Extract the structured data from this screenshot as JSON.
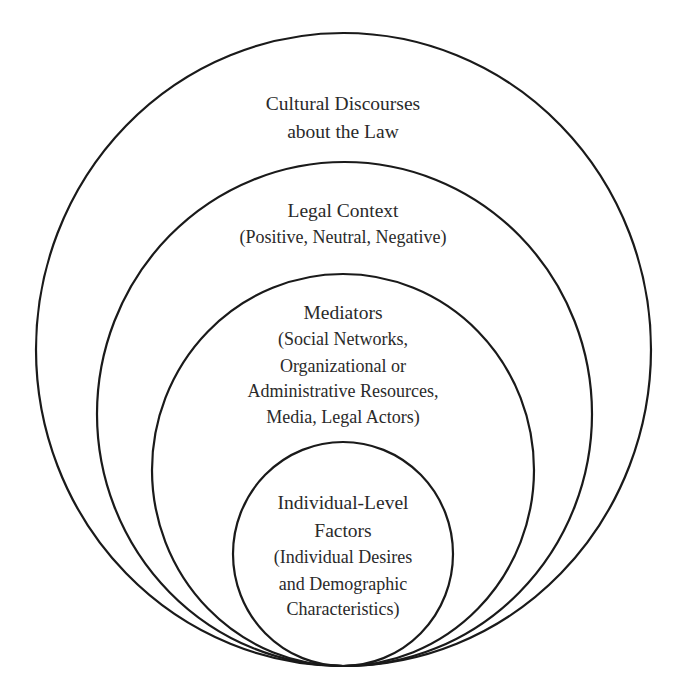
{
  "diagram": {
    "type": "nested-circles",
    "stroke_color": "#1a1a1a",
    "text_color": "#2a2a2a",
    "levels": [
      {
        "id": "cultural-discourses",
        "title_lines": [
          "Cultural Discourses",
          "about the Law"
        ],
        "sub_lines": []
      },
      {
        "id": "legal-context",
        "title_lines": [
          "Legal Context"
        ],
        "sub_lines": [
          "(Positive, Neutral, Negative)"
        ]
      },
      {
        "id": "mediators",
        "title_lines": [
          "Mediators"
        ],
        "sub_lines": [
          "(Social Networks,",
          "Organizational or",
          "Administrative Resources,",
          "Media, Legal Actors)"
        ]
      },
      {
        "id": "individual-level-factors",
        "title_lines": [
          "Individual-Level",
          "Factors"
        ],
        "sub_lines": [
          "(Individual Desires",
          "and Demographic",
          "Characteristics)"
        ]
      }
    ]
  }
}
